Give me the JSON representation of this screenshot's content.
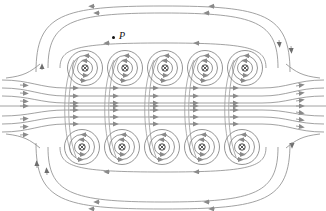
{
  "figure": {
    "type": "magnetic-field-line-diagram",
    "background_color": "#ffffff",
    "line_color": "#808080",
    "dark_color": "#4a4a4a",
    "ink_color": "#111111",
    "width": 326,
    "height": 211
  },
  "annotations": {
    "point_p": {
      "label": "P",
      "dot_icon": "filled-dot",
      "dot_x": 112,
      "dot_y": 36,
      "label_x": 119,
      "label_y": 31
    }
  },
  "conductors": {
    "symbol": "current-into-page",
    "glyph": "⊗",
    "rows": [
      {
        "name": "top-row",
        "cy": 68,
        "centers_x": [
          85,
          125,
          165,
          205,
          245
        ],
        "ring_radii": [
          3.0,
          7.5,
          12.5,
          17.5
        ]
      },
      {
        "name": "bottom-row",
        "cy": 147,
        "centers_x": [
          82,
          122,
          162,
          202,
          242
        ],
        "ring_radii": [
          3.0,
          7.5,
          12.5,
          17.5
        ]
      }
    ]
  },
  "field": {
    "interior_direction": "right",
    "exterior_direction": "left",
    "interior_lines_y": [
      88,
      96,
      103,
      110,
      117,
      124
    ],
    "interior_arrow_x": [
      72,
      112,
      152,
      192,
      232,
      268
    ],
    "outer_loop_top_y": 14,
    "outer_loop_bottom_y": 196,
    "inner_loop_top_y": 52,
    "inner_loop_bottom_y": 164
  },
  "chart_data": {
    "type": "line",
    "title": "",
    "xlabel": "",
    "ylabel": "",
    "series": [
      {
        "name": "interior-field-lines",
        "direction": "right",
        "count": 6
      },
      {
        "name": "outer-return-loops",
        "direction": "left",
        "count": 4
      },
      {
        "name": "conductor-encircling-loops",
        "direction": "clockwise",
        "count": 10
      }
    ],
    "annotations": [
      "P"
    ]
  }
}
